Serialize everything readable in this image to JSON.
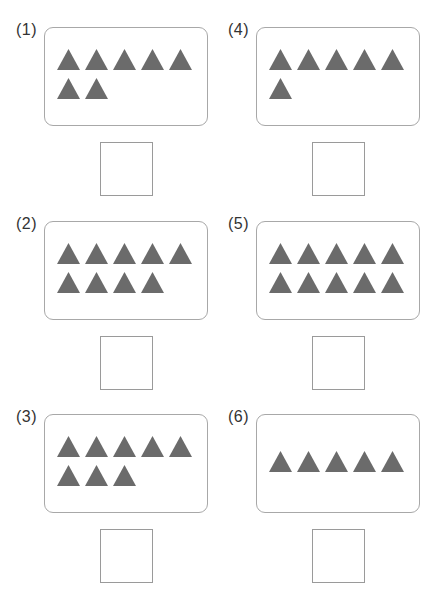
{
  "worksheet": {
    "shape": "triangle",
    "shape_color": "#6b6b6b",
    "problems": [
      {
        "label": "(1)",
        "count": 7,
        "answer": ""
      },
      {
        "label": "(2)",
        "count": 9,
        "answer": ""
      },
      {
        "label": "(3)",
        "count": 8,
        "answer": ""
      },
      {
        "label": "(4)",
        "count": 6,
        "answer": ""
      },
      {
        "label": "(5)",
        "count": 10,
        "answer": ""
      },
      {
        "label": "(6)",
        "count": 5,
        "answer": ""
      }
    ]
  }
}
